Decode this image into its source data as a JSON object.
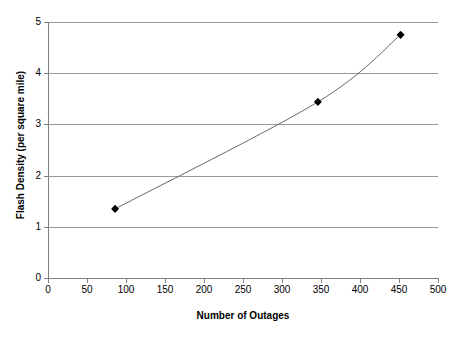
{
  "chart_data": {
    "type": "line",
    "title": "",
    "xlabel": "Number of Outages",
    "ylabel": "Flash Density (per square mile)",
    "xlim": [
      0,
      500
    ],
    "ylim": [
      0,
      5
    ],
    "xticks": [
      0,
      50,
      100,
      150,
      200,
      250,
      300,
      350,
      400,
      450,
      500
    ],
    "xtick_labels": [
      "0",
      "50",
      "100",
      "150",
      "200",
      "250",
      "300",
      "350",
      "400",
      "450",
      "500"
    ],
    "yticks": [
      0,
      1,
      2,
      3,
      4,
      5
    ],
    "ytick_labels": [
      "0",
      "1",
      "2",
      "3",
      "4",
      "5"
    ],
    "grid": "horizontal",
    "legend": "none",
    "marker": "filled-diamond",
    "line_color": "#666666",
    "marker_color": "#000000",
    "grid_color": "#9a9a9a",
    "series": [
      {
        "name": "Flash Density vs Outages",
        "points": [
          {
            "x": 86,
            "y": 1.35
          },
          {
            "x": 346,
            "y": 3.44
          },
          {
            "x": 452,
            "y": 4.75
          }
        ]
      }
    ]
  },
  "axis_titles": {
    "x": "Number of Outages",
    "y": "Flash Density (per square mile)"
  }
}
